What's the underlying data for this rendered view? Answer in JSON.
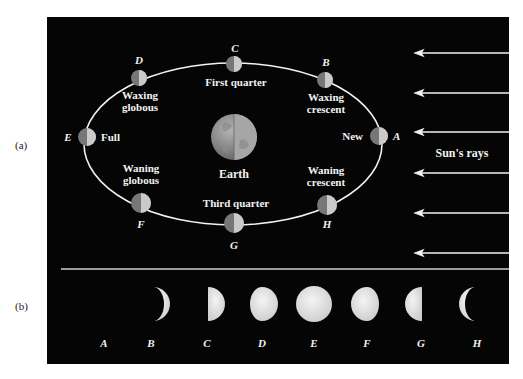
{
  "panels": {
    "a_label": "(a)",
    "b_label": "(b)"
  },
  "orbit": {
    "earth_label": "Earth",
    "sun_rays_label": "Sun's rays",
    "positions": [
      {
        "letter": "A",
        "name": "New",
        "cx": 379,
        "cy": 136
      },
      {
        "letter": "B",
        "name_line1": "Waxing",
        "name_line2": "crescent",
        "cx": 325,
        "cy": 80
      },
      {
        "letter": "C",
        "name": "First quarter",
        "cx": 234,
        "cy": 64
      },
      {
        "letter": "D",
        "name_line1": "Waxing",
        "name_line2": "globous",
        "cx": 139,
        "cy": 78
      },
      {
        "letter": "E",
        "name": "Full",
        "cx": 87,
        "cy": 137
      },
      {
        "letter": "F",
        "name_line1": "Waning",
        "name_line2": "globous",
        "cx": 141,
        "cy": 203
      },
      {
        "letter": "G",
        "name": "Third quarter",
        "cx": 234,
        "cy": 223
      },
      {
        "letter": "H",
        "name_line1": "Waning",
        "name_line2": "crescent",
        "cx": 327,
        "cy": 205
      }
    ]
  },
  "phases_row": {
    "letters": [
      "A",
      "B",
      "C",
      "D",
      "E",
      "F",
      "G",
      "H"
    ]
  },
  "colors": {
    "background": "#050505",
    "foreground": "#f2f2f2",
    "moon_dark": "#777777",
    "moon_light": "#c8c8c8",
    "phase_fill": "#e6e6e6"
  }
}
